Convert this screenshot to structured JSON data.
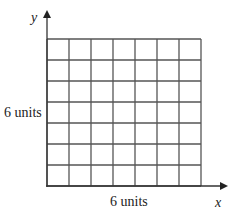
{
  "diagram": {
    "type": "grid-on-axes",
    "axes": {
      "x_label": "x",
      "y_label": "y"
    },
    "grid": {
      "columns": 7,
      "rows": 7,
      "line_color": "#555555"
    },
    "dimension_labels": {
      "height": "6 units",
      "width": "6 units"
    }
  }
}
